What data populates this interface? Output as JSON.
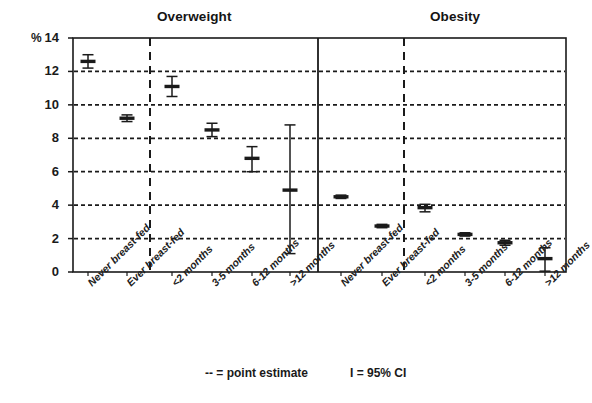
{
  "panels": {
    "left_title": "Overweight",
    "right_title": "Obesity"
  },
  "axis": {
    "unit_symbol": "%",
    "y_ticks": [
      "14",
      "12",
      "10",
      "8",
      "6",
      "4",
      "2",
      "0"
    ]
  },
  "legend": {
    "point_estimate": "-- = point estimate",
    "confidence_interval": "I = 95% CI"
  },
  "x_labels": [
    "Never breast-fed",
    "Ever breast-fed",
    "<2 months",
    "3-5 months",
    "6-12 months",
    ">12 months",
    "Never breast-fed",
    "Ever breast-fed",
    "<2 months",
    "3-5 months",
    "6-12 months",
    ">12 months"
  ],
  "chart_data": {
    "type": "scatter",
    "title": "",
    "subtitle": "",
    "xlabel": "",
    "ylabel": "%",
    "ylim": [
      0,
      14
    ],
    "y_ticks": [
      0,
      2,
      4,
      6,
      8,
      10,
      12,
      14
    ],
    "grid": "horizontal-dotted-at-even-ticks",
    "legend_position": "below-plot",
    "annotations": [
      "-- = point estimate",
      "I = 95% CI"
    ],
    "panels": [
      {
        "name": "Overweight",
        "categories": [
          "Never breast-fed",
          "Ever breast-fed",
          "<2 months",
          "3-5 months",
          "6-12 months",
          ">12 months"
        ],
        "values": [
          12.6,
          9.2,
          11.1,
          8.5,
          6.8,
          4.9
        ],
        "ci_low": [
          12.2,
          9.0,
          10.5,
          8.1,
          6.0,
          1.1
        ],
        "ci_high": [
          13.0,
          9.4,
          11.7,
          8.9,
          7.5,
          8.8
        ]
      },
      {
        "name": "Obesity",
        "categories": [
          "Never breast-fed",
          "Ever breast-fed",
          "<2 months",
          "3-5 months",
          "6-12 months",
          ">12 months"
        ],
        "values": [
          4.5,
          2.75,
          3.85,
          2.25,
          1.75,
          0.8
        ],
        "ci_low": [
          4.4,
          2.65,
          3.6,
          2.15,
          1.6,
          0.05
        ],
        "ci_high": [
          4.6,
          2.85,
          4.05,
          2.35,
          1.9,
          1.45
        ]
      }
    ]
  },
  "colors": {
    "ink": "#1a1a1a",
    "grid": "#1a1a1a",
    "background": "#ffffff"
  }
}
